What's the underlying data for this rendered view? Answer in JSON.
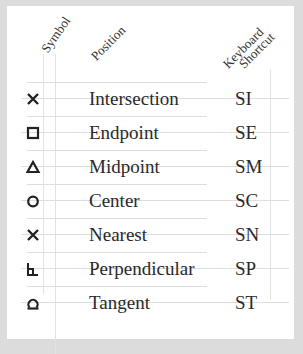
{
  "headers": {
    "symbol": "Symbol",
    "position": "Position",
    "keyboard": "Keyboard",
    "shortcut": "Shortcut"
  },
  "rows": [
    {
      "icon": "cross-icon",
      "position": "Intersection",
      "shortcut": "SI"
    },
    {
      "icon": "square-icon",
      "position": "Endpoint",
      "shortcut": "SE"
    },
    {
      "icon": "triangle-icon",
      "position": "Midpoint",
      "shortcut": "SM"
    },
    {
      "icon": "circle-icon",
      "position": "Center",
      "shortcut": "SC"
    },
    {
      "icon": "cross-icon",
      "position": "Nearest",
      "shortcut": "SN"
    },
    {
      "icon": "perpendicular-icon",
      "position": "Perpendicular",
      "shortcut": "SP"
    },
    {
      "icon": "tangent-icon",
      "position": "Tangent",
      "shortcut": "ST"
    }
  ]
}
